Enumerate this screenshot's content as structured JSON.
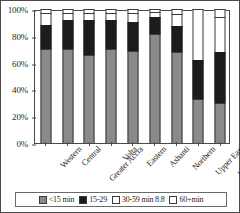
{
  "chart_data": {
    "type": "bar",
    "subtype": "stacked-100-percent",
    "title": "",
    "xlabel": "",
    "ylabel": "",
    "ylim": [
      0,
      100
    ],
    "yticks": [
      "0%",
      "20%",
      "40%",
      "60%",
      "80%",
      "100%"
    ],
    "ytick_values": [
      0,
      20,
      40,
      60,
      80,
      100
    ],
    "grid": false,
    "legend_position": "bottom",
    "categories": [
      "Western",
      "Central",
      "Greater Accra",
      "Volta",
      "Eastern",
      "Ashanti",
      "Northern",
      "Upper East",
      "Upper West"
    ],
    "series": [
      {
        "name": "<15 min",
        "color": "#8a8a8a",
        "values": [
          70,
          70,
          66,
          70,
          69,
          81,
          68,
          33,
          30
        ]
      },
      {
        "name": "15-29",
        "color": "#1c1c1c",
        "values": [
          18,
          22,
          26,
          22,
          21,
          13,
          19,
          29,
          38
        ]
      },
      {
        "name": "30-59 min 8.8",
        "color": "#ffffff",
        "values": [
          9,
          5,
          5,
          5,
          7,
          4,
          9,
          38,
          26
        ]
      },
      {
        "name": "60+min",
        "color": "#ffffff",
        "values": [
          3,
          3,
          3,
          3,
          3,
          2,
          4,
          0,
          6
        ]
      }
    ],
    "legend_entries": [
      "<15 min",
      "15-29",
      "30-59 min 8.8",
      "60+min"
    ]
  }
}
